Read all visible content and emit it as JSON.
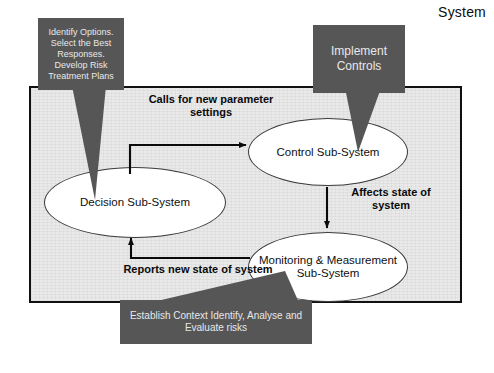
{
  "diagram": {
    "boundary_label": "System",
    "nodes": [
      {
        "id": "decision",
        "label": "Decision Sub-System"
      },
      {
        "id": "control",
        "label": "Control Sub-System"
      },
      {
        "id": "monitor",
        "label": "Monitoring & Measurement Sub-System"
      }
    ],
    "flows": [
      {
        "id": "calls",
        "label": "Calls for new parameter settings",
        "from": "decision",
        "to": "control"
      },
      {
        "id": "affects",
        "label": "Affects state of system",
        "from": "control",
        "to": "monitor"
      },
      {
        "id": "reports",
        "label": "Reports new state of system",
        "from": "monitor",
        "to": "decision"
      }
    ],
    "callouts": [
      {
        "id": "identify",
        "label": "Identify Options. Select the Best Responses. Develop Risk Treatment Plans",
        "points_to": "decision"
      },
      {
        "id": "implement",
        "label": "Implement Controls",
        "points_to": "control"
      },
      {
        "id": "establish",
        "label": "Establish Context Identify, Analyse and Evaluate risks",
        "points_to": "monitor"
      }
    ],
    "colors": {
      "callout_fill": "#565656",
      "callout_text": "#e8e8e8",
      "boundary_fill": "#e9e9e9",
      "boundary_stroke": "#111111",
      "node_fill": "#ffffff",
      "node_stroke": "#3a3a3a",
      "arrow": "#0a0a0a"
    }
  }
}
